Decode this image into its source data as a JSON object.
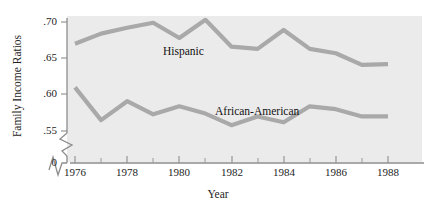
{
  "chart_data": {
    "type": "line",
    "title": "",
    "xlabel": "Year",
    "ylabel": "Family Income Ratios",
    "x": [
      1976,
      1977,
      1978,
      1979,
      1980,
      1981,
      1982,
      1983,
      1984,
      1985,
      1986,
      1987,
      1988
    ],
    "xtick_labels": [
      "1976",
      "1978",
      "1980",
      "1982",
      "1984",
      "1986",
      "1988"
    ],
    "xtick_values": [
      1976,
      1978,
      1980,
      1982,
      1984,
      1986,
      1988
    ],
    "xminor_ticks": [
      1977,
      1979,
      1981,
      1983,
      1985,
      1987
    ],
    "ytick_labels": [
      ".70",
      ".65",
      ".60",
      ".55",
      "0"
    ],
    "ytick_values": [
      0.7,
      0.65,
      0.6,
      0.55,
      0.0
    ],
    "ylim": [
      0.535,
      0.715
    ],
    "xlim": [
      1975.6,
      1988.5
    ],
    "grid": false,
    "legend_position": "inline-labels",
    "axis_break_y": true,
    "axis_break_x": true,
    "series": [
      {
        "name": "Hispanic",
        "color": "#a9a9a9",
        "values": [
          0.67,
          0.684,
          0.692,
          0.699,
          0.678,
          0.703,
          0.666,
          0.663,
          0.689,
          0.663,
          0.657,
          0.641,
          0.642
        ]
      },
      {
        "name": "African-American",
        "color": "#a9a9a9",
        "values": [
          0.61,
          0.565,
          0.591,
          0.573,
          0.584,
          0.574,
          0.558,
          0.57,
          0.562,
          0.584,
          0.58,
          0.57,
          0.57
        ]
      }
    ],
    "annotations": [
      {
        "text": "Hispanic",
        "x": 1981,
        "y": 0.682
      },
      {
        "text": "African-American",
        "x": 1984,
        "y": 0.587
      }
    ]
  },
  "axis": {
    "y_title": "Family Income Ratios",
    "x_title": "Year",
    "ytick_0": ".70",
    "ytick_1": ".65",
    "ytick_2": ".60",
    "ytick_3": ".55",
    "ytick_4": "0",
    "xtick_0": "1976",
    "xtick_1": "1978",
    "xtick_2": "1980",
    "xtick_3": "1982",
    "xtick_4": "1984",
    "xtick_5": "1986",
    "xtick_6": "1988"
  },
  "labels": {
    "hispanic": "Hispanic",
    "african_american": "African-American"
  },
  "colors": {
    "plot_background": "#ebebeb",
    "line": "#a9a9a9",
    "axis": "#8d8d8d",
    "text": "#1d1d1d"
  }
}
